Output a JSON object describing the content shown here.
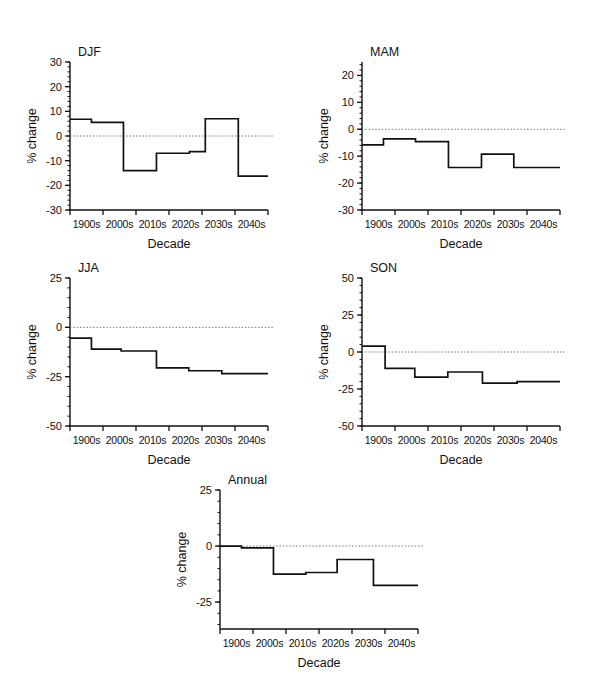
{
  "figure": {
    "background": "#ffffff",
    "line_color": "#111111",
    "zero_line_color": "#777777"
  },
  "common": {
    "xlabel": "Decade",
    "ylabel": "% change",
    "categories": [
      "1900s",
      "2000s",
      "2010s",
      "2020s",
      "2030s",
      "2040s"
    ]
  },
  "chart_data": [
    {
      "type": "line",
      "subtype": "step",
      "title": "DJF",
      "xlabel": "Decade",
      "ylabel": "% change",
      "categories": [
        "1900s",
        "2000s",
        "2010s",
        "2020s",
        "2030s",
        "2040s"
      ],
      "ylim": [
        -30,
        30
      ],
      "yticks": [
        -30,
        -20,
        -10,
        0,
        10,
        20,
        30
      ],
      "ytick_labels": [
        "-30",
        "-20",
        "-10",
        "0",
        "10",
        "20",
        "30"
      ],
      "minor_tick_interval": 2,
      "zero_reference_line": 0,
      "grid": false,
      "legend": "none",
      "steps": [
        {
          "x_start": -0.5,
          "x_end": 0.15,
          "value": 6.8
        },
        {
          "x_start": 0.15,
          "x_end": 1.12,
          "value": 5.5
        },
        {
          "x_start": 1.12,
          "x_end": 2.12,
          "value": -14.0
        },
        {
          "x_start": 2.12,
          "x_end": 3.12,
          "value": -7.0
        },
        {
          "x_start": 3.12,
          "x_end": 3.6,
          "value": -6.3
        },
        {
          "x_start": 3.6,
          "x_end": 4.6,
          "value": 7.0
        },
        {
          "x_start": 4.6,
          "x_end": 5.5,
          "value": -16.3
        }
      ],
      "values": [
        6.8,
        5.5,
        -14.0,
        -7.0,
        -6.3,
        7.0,
        -16.3
      ]
    },
    {
      "type": "line",
      "subtype": "step",
      "title": "MAM",
      "xlabel": "Decade",
      "ylabel": "% change",
      "categories": [
        "1900s",
        "2000s",
        "2010s",
        "2020s",
        "2030s",
        "2040s"
      ],
      "ylim": [
        -30,
        25
      ],
      "yticks": [
        -30,
        -20,
        -10,
        0,
        10,
        20
      ],
      "ytick_labels": [
        "-30",
        "-20",
        "-10",
        "0",
        "10",
        "20"
      ],
      "minor_tick_interval": 2,
      "zero_reference_line": 0,
      "grid": false,
      "legend": "none",
      "steps": [
        {
          "x_start": -0.5,
          "x_end": 0.15,
          "value": -5.8
        },
        {
          "x_start": 0.15,
          "x_end": 1.12,
          "value": -3.6
        },
        {
          "x_start": 1.12,
          "x_end": 2.12,
          "value": -4.6
        },
        {
          "x_start": 2.12,
          "x_end": 3.12,
          "value": -14.2
        },
        {
          "x_start": 3.12,
          "x_end": 4.1,
          "value": -9.2
        },
        {
          "x_start": 4.1,
          "x_end": 5.5,
          "value": -14.2
        }
      ],
      "values": [
        -5.8,
        -3.6,
        -4.6,
        -14.2,
        -9.2,
        -14.2
      ]
    },
    {
      "type": "line",
      "subtype": "step",
      "title": "JJA",
      "xlabel": "Decade",
      "ylabel": "% change",
      "categories": [
        "1900s",
        "2000s",
        "2010s",
        "2020s",
        "2030s",
        "2040s"
      ],
      "ylim": [
        -50,
        25
      ],
      "yticks": [
        -50,
        -25,
        0,
        25
      ],
      "ytick_labels": [
        "-50",
        "-25",
        "0",
        "25"
      ],
      "minor_tick_interval": 5,
      "zero_reference_line": 0,
      "grid": false,
      "legend": "none",
      "steps": [
        {
          "x_start": -0.5,
          "x_end": 0.15,
          "value": -5.5
        },
        {
          "x_start": 0.15,
          "x_end": 1.05,
          "value": -11.0
        },
        {
          "x_start": 1.05,
          "x_end": 2.12,
          "value": -12.0
        },
        {
          "x_start": 2.12,
          "x_end": 3.1,
          "value": -20.5
        },
        {
          "x_start": 3.1,
          "x_end": 4.1,
          "value": -22.0
        },
        {
          "x_start": 4.1,
          "x_end": 5.5,
          "value": -23.5
        }
      ],
      "values": [
        -5.5,
        -11.0,
        -12.0,
        -20.5,
        -22.0,
        -23.5
      ]
    },
    {
      "type": "line",
      "subtype": "step",
      "title": "SON",
      "xlabel": "Decade",
      "ylabel": "% change",
      "categories": [
        "1900s",
        "2000s",
        "2010s",
        "2020s",
        "2030s",
        "2040s"
      ],
      "ylim": [
        -50,
        50
      ],
      "yticks": [
        -50,
        -25,
        0,
        25,
        50
      ],
      "ytick_labels": [
        "-50",
        "-25",
        "0",
        "25",
        "50"
      ],
      "minor_tick_interval": 5,
      "zero_reference_line": 0,
      "grid": false,
      "legend": "none",
      "steps": [
        {
          "x_start": -0.5,
          "x_end": 0.2,
          "value": 4.0
        },
        {
          "x_start": 0.2,
          "x_end": 1.1,
          "value": -11.0
        },
        {
          "x_start": 1.1,
          "x_end": 2.1,
          "value": -17.0
        },
        {
          "x_start": 2.1,
          "x_end": 3.15,
          "value": -13.5
        },
        {
          "x_start": 3.15,
          "x_end": 4.2,
          "value": -21.0
        },
        {
          "x_start": 4.2,
          "x_end": 5.5,
          "value": -20.0
        }
      ],
      "values": [
        4.0,
        -11.0,
        -17.0,
        -13.5,
        -21.0,
        -20.0
      ]
    },
    {
      "type": "line",
      "subtype": "step",
      "title": "Annual",
      "xlabel": "Decade",
      "ylabel": "% change",
      "categories": [
        "1900s",
        "2000s",
        "2010s",
        "2020s",
        "2030s",
        "2040s"
      ],
      "ylim": [
        -37,
        25
      ],
      "yticks": [
        -25,
        0,
        25
      ],
      "ytick_labels": [
        "-25",
        "0",
        "25"
      ],
      "minor_tick_interval": 5,
      "zero_reference_line": 0,
      "grid": false,
      "legend": "none",
      "steps": [
        {
          "x_start": -0.5,
          "x_end": 0.15,
          "value": 0.0
        },
        {
          "x_start": 0.15,
          "x_end": 1.12,
          "value": -0.8
        },
        {
          "x_start": 1.12,
          "x_end": 2.1,
          "value": -12.5
        },
        {
          "x_start": 2.1,
          "x_end": 3.05,
          "value": -11.8
        },
        {
          "x_start": 3.05,
          "x_end": 4.15,
          "value": -6.0
        },
        {
          "x_start": 4.15,
          "x_end": 5.5,
          "value": -17.5
        }
      ],
      "values": [
        0.0,
        -0.8,
        -12.5,
        -11.8,
        -6.0,
        -17.5
      ]
    }
  ]
}
